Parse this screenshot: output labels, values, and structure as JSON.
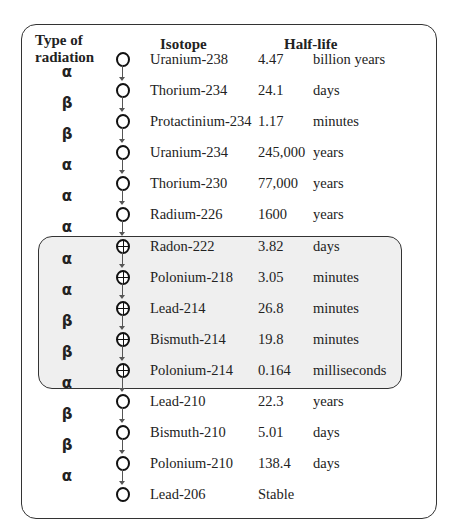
{
  "headers": {
    "type_line1": "Type of",
    "type_line2": "radiation",
    "isotope": "Isotope",
    "half_life": "Half-life"
  },
  "rows": [
    {
      "isotope": "Uranium-238",
      "value": "4.47",
      "unit": "billion years",
      "hatched": false
    },
    {
      "isotope": "Thorium-234",
      "value": "24.1",
      "unit": "days",
      "hatched": false
    },
    {
      "isotope": "Protactinium-234",
      "value": "1.17",
      "unit": "minutes",
      "hatched": false
    },
    {
      "isotope": "Uranium-234",
      "value": "245,000",
      "unit": "years",
      "hatched": false
    },
    {
      "isotope": "Thorium-230",
      "value": "77,000",
      "unit": "years",
      "hatched": false
    },
    {
      "isotope": "Radium-226",
      "value": "1600",
      "unit": "years",
      "hatched": false
    },
    {
      "isotope": "Radon-222",
      "value": "3.82",
      "unit": "days",
      "hatched": true
    },
    {
      "isotope": "Polonium-218",
      "value": "3.05",
      "unit": "minutes",
      "hatched": true
    },
    {
      "isotope": "Lead-214",
      "value": "26.8",
      "unit": "minutes",
      "hatched": true
    },
    {
      "isotope": "Bismuth-214",
      "value": "19.8",
      "unit": "minutes",
      "hatched": true
    },
    {
      "isotope": "Polonium-214",
      "value": "0.164",
      "unit": "milliseconds",
      "hatched": true
    },
    {
      "isotope": "Lead-210",
      "value": "22.3",
      "unit": "years",
      "hatched": false
    },
    {
      "isotope": "Bismuth-210",
      "value": "5.01",
      "unit": "days",
      "hatched": false
    },
    {
      "isotope": "Polonium-210",
      "value": "138.4",
      "unit": "days",
      "hatched": false
    },
    {
      "isotope": "Lead-206",
      "value": "Stable",
      "unit": "",
      "hatched": false
    }
  ],
  "radiation": [
    "α",
    "β",
    "β",
    "α",
    "α",
    "α",
    "α",
    "α",
    "β",
    "β",
    "α",
    "β",
    "β",
    "α"
  ],
  "highlight_group": [
    "Radon-222",
    "Polonium-218",
    "Lead-214",
    "Bismuth-214",
    "Polonium-214"
  ],
  "colors": {
    "highlight_fill": "#efefef",
    "border": "#333333"
  }
}
